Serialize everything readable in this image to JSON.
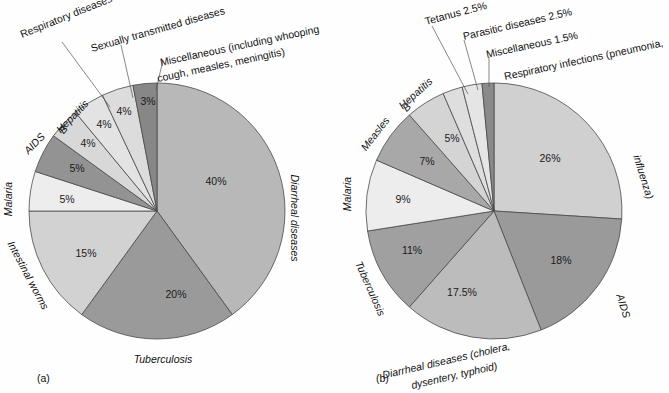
{
  "figure": {
    "panel_a_caption": "(a)",
    "panel_b_caption": "(b)"
  },
  "chart_data": [
    {
      "type": "pie",
      "id": "panel-a",
      "title": "",
      "caption": "(a)",
      "legend": "labels-outside",
      "start_angle_deg": 0,
      "direction": "clockwise",
      "center": [
        157,
        211
      ],
      "radius": 128,
      "categories": [
        "Diarrheal diseases",
        "Tuberculosis",
        "Intestinal worms",
        "Malaria",
        "AIDS",
        "Hepatitis B",
        "Respiratory diseases",
        "Sexually transmitted diseases",
        "Miscellaneous (including whooping cough, measles, meningitis)"
      ],
      "values": [
        40,
        20,
        15,
        5,
        5,
        4,
        4,
        4,
        3
      ],
      "value_labels": [
        "40%",
        "20%",
        "15%",
        "5%",
        "5%",
        "4%",
        "4%",
        "4%",
        "3%"
      ],
      "colors": [
        "#b8b8b8",
        "#9a9a9a",
        "#d2d2d2",
        "#ededed",
        "#939393",
        "#d8d8d8",
        "#e3e3e3",
        "#dcdcdc",
        "#878787"
      ]
    },
    {
      "type": "pie",
      "id": "panel-b",
      "title": "",
      "caption": "(b)",
      "legend": "labels-outside",
      "start_angle_deg": 0,
      "direction": "clockwise",
      "center": [
        494,
        211
      ],
      "radius": 128,
      "categories": [
        "Respiratory infections (pneumonia, influenza)",
        "AIDS",
        "Diarrheal diseases (cholera, dysentery, typhoid)",
        "Tuberculosis",
        "Malaria",
        "Measles",
        "Hepatitis B",
        "Tetanus",
        "Parasitic diseases",
        "Miscellaneous"
      ],
      "values": [
        26,
        18,
        17.5,
        11,
        9,
        7,
        5,
        2.5,
        2.5,
        1.5
      ],
      "value_labels": [
        "26%",
        "18%",
        "17.5%",
        "11%",
        "9%",
        "7%",
        "5%",
        "2.5%",
        "2.5%",
        "1.5%"
      ],
      "colors": [
        "#d0d0d0",
        "#9a9a9a",
        "#bcbcbc",
        "#a0a0a0",
        "#ededed",
        "#a8a8a8",
        "#d4d4d4",
        "#dedede",
        "#e5e5e5",
        "#8a8a8a"
      ]
    }
  ],
  "panel_a": {
    "labels": {
      "respiratory": "Respiratory diseases",
      "sexually_transmitted": "Sexually transmitted diseases",
      "misc_line1": "Miscellaneous (including whooping",
      "misc_line2": "cough, measles, meningitis)",
      "diarrheal": "Diarrheal diseases",
      "tuberculosis": "Tuberculosis",
      "intestinal_worms": "Intestinal worms",
      "malaria": "Malaria",
      "aids": "AIDS",
      "hepatitis_b_line1": "Hepatitis",
      "hepatitis_b_line2": "B"
    },
    "percents": {
      "diarrheal": "40%",
      "tuberculosis": "20%",
      "intestinal_worms": "15%",
      "malaria": "5%",
      "aids": "5%",
      "hepatitis_b": "4%",
      "respiratory": "4%",
      "sexually_transmitted": "4%",
      "misc": "3%"
    }
  },
  "panel_b": {
    "labels": {
      "tetanus": "Tetanus 2.5%",
      "parasitic": "Parasitic diseases 2.5%",
      "misc": "Miscellaneous 1.5%",
      "respiratory_line1": "Respiratory infections (pneumonia,",
      "respiratory_line2": "influenza)",
      "aids": "AIDS",
      "diarrheal_line1": "Diarrheal diseases (cholera,",
      "diarrheal_line2": "dysentery, typhoid)",
      "tuberculosis": "Tuberculosis",
      "malaria": "Malaria",
      "measles": "Measles",
      "hepatitis_b_line1": "Hepatitis",
      "hepatitis_b_line2": "B"
    },
    "percents": {
      "respiratory": "26%",
      "aids": "18%",
      "diarrheal": "17.5%",
      "tuberculosis": "11%",
      "malaria": "9%",
      "measles": "7%",
      "hepatitis_b": "5%"
    }
  }
}
